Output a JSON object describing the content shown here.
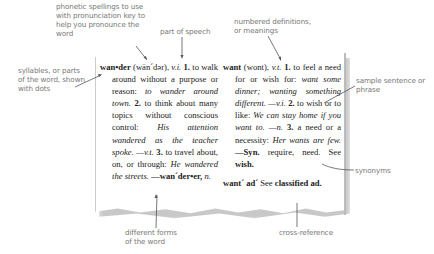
{
  "annotations": {
    "phonetic": "phonetic spellings to use with pronunciation key to help you pronounce the word",
    "part_of_speech": "part of speech",
    "numbered_definitions": "numbered definitions, or meanings",
    "syllables": "syllables, or parts of the word, shown with dots",
    "sample_sentence": "sample sentence or phrase",
    "synonyms": "synonyms",
    "different_forms": "different forms of the word",
    "cross_reference": "cross-reference"
  },
  "entries": {
    "wander": {
      "headword": "wan•der",
      "pronunciation": "(wän´dər),",
      "pos1": "v.i.",
      "def1_num": "1.",
      "def1": "to walk around without a purpose or reason:",
      "ex1": "to wander around town.",
      "def2_num": "2.",
      "def2": "to think about many topics without conscious control:",
      "ex2": "His attention wandered as the teacher spoke.",
      "pos2": "—v.t.",
      "def3_num": "3.",
      "def3": "to travel about, on, or through:",
      "ex3": "He wandered the streets.",
      "form": "—wan´der•er,",
      "form_pos": "n."
    },
    "want": {
      "headword": "want",
      "pronunciation": "(wont),",
      "pos1": "v.t.",
      "def1_num": "1.",
      "def1": "to feel a need for or wish for:",
      "ex1": "want some dinner; wanting something different.",
      "pos2": "—v.i.",
      "def2_num": "2.",
      "def2": "to wish or to like:",
      "ex2": "We can stay home if you want to.",
      "pos3": "—n.",
      "def3_num": "3.",
      "def3": "a need or a necessity:",
      "ex3": "Her wants are few.",
      "syn_label": "—Syn.",
      "syn": "require, need.",
      "see": "See",
      "see_word": "wish."
    },
    "want_ad": {
      "headword": "want´ ad´",
      "see": "See",
      "ref": "classified ad."
    }
  }
}
